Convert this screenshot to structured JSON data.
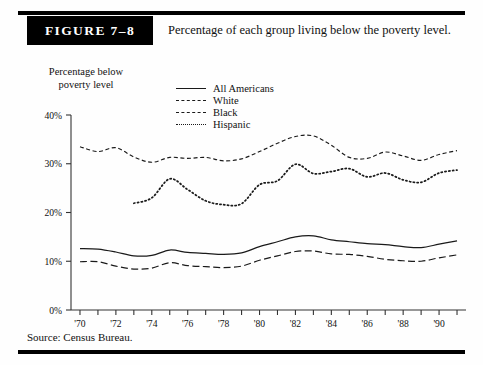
{
  "figure": {
    "badge": "FIGURE 7–8",
    "title": "Percentage of each group living below the poverty level.",
    "source": "Source:  Census Bureau."
  },
  "axis_label": {
    "line1": "Percentage below",
    "line2": "poverty level"
  },
  "legend": {
    "items": [
      {
        "label": "All Americans",
        "style": "solid"
      },
      {
        "label": "White",
        "style": "dash-long"
      },
      {
        "label": "Black",
        "style": "dash-short"
      },
      {
        "label": "Hispanic",
        "style": "dotted"
      }
    ]
  },
  "chart_data": {
    "type": "line",
    "title": "Percentage of each group living below the poverty level.",
    "xlabel": "",
    "ylabel": "Percentage below poverty level",
    "xlim": [
      1969.5,
      1991.5
    ],
    "ylim": [
      0,
      40
    ],
    "yticks": [
      0,
      10,
      20,
      30,
      40
    ],
    "ytick_labels": [
      "0%",
      "10%",
      "20%",
      "30%",
      "40%"
    ],
    "xticks": [
      1970,
      1971,
      1972,
      1973,
      1974,
      1975,
      1976,
      1977,
      1978,
      1979,
      1980,
      1981,
      1982,
      1983,
      1984,
      1985,
      1986,
      1987,
      1988,
      1989,
      1990,
      1991
    ],
    "xtick_labels": [
      "'70",
      "",
      "'72",
      "",
      "'74",
      "",
      "'76",
      "",
      "'78",
      "",
      "'80",
      "",
      "'82",
      "",
      "'84",
      "",
      "'86",
      "",
      "'88",
      "",
      "'90",
      ""
    ],
    "grid": false,
    "legend_position": "upper-center",
    "x": [
      1970,
      1971,
      1972,
      1973,
      1974,
      1975,
      1976,
      1977,
      1978,
      1979,
      1980,
      1981,
      1982,
      1983,
      1984,
      1985,
      1986,
      1987,
      1988,
      1989,
      1990,
      1991
    ],
    "series": [
      {
        "name": "All Americans",
        "style": "solid",
        "values": [
          12.6,
          12.5,
          11.9,
          11.1,
          11.2,
          12.3,
          11.8,
          11.6,
          11.4,
          11.7,
          13.0,
          14.0,
          15.0,
          15.2,
          14.4,
          14.0,
          13.6,
          13.4,
          13.0,
          12.8,
          13.5,
          14.2
        ]
      },
      {
        "name": "White",
        "style": "dash-long",
        "values": [
          9.9,
          9.9,
          9.0,
          8.4,
          8.6,
          9.7,
          9.1,
          8.9,
          8.7,
          9.0,
          10.2,
          11.1,
          12.0,
          12.1,
          11.5,
          11.4,
          11.0,
          10.4,
          10.1,
          10.0,
          10.7,
          11.3
        ]
      },
      {
        "name": "Black",
        "style": "dash-short",
        "values": [
          33.5,
          32.5,
          33.3,
          31.4,
          30.3,
          31.3,
          31.1,
          31.3,
          30.6,
          31.0,
          32.5,
          34.2,
          35.6,
          35.7,
          33.8,
          31.3,
          31.1,
          32.4,
          31.6,
          30.7,
          31.9,
          32.7
        ]
      },
      {
        "name": "Hispanic",
        "style": "dotted",
        "values": [
          null,
          null,
          null,
          21.9,
          23.0,
          26.9,
          24.7,
          22.4,
          21.6,
          21.8,
          25.7,
          26.5,
          29.9,
          28.0,
          28.4,
          29.0,
          27.3,
          28.1,
          26.7,
          26.2,
          28.1,
          28.7
        ]
      }
    ]
  }
}
